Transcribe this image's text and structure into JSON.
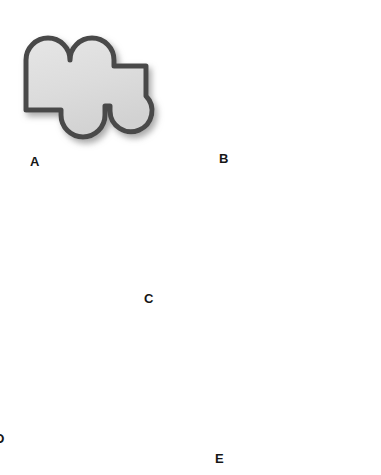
{
  "figure": {
    "background_color": "#ffffff",
    "shape_fill_color": "#d8d8d8",
    "shape_fill_color_light": "#e4e4e4",
    "shape_stroke_color": "#4a4a4a",
    "shape_shadow_color": "#b4b4b4",
    "label_color": "#161616",
    "stroke_width": 5
  },
  "shapes": [
    {
      "id": "A",
      "label": "A",
      "label_x": 30,
      "label_y": 155,
      "description": "rectangle with two round lobes on top, one lobe bottom-left, one lobe bottom-right, plus right arm",
      "clipped": false
    },
    {
      "id": "B",
      "label": "B",
      "label_x": 219,
      "label_y": 152,
      "description": "horizontal bar with two lobes on left, three stacked lobes on right, lower rectangle foot",
      "clipped": false
    },
    {
      "id": "C",
      "label": "C",
      "label_x": 144,
      "label_y": 292,
      "description": "small rectangle with one lobe top-left, one lobe right, one lobe bottom-center",
      "clipped": false
    },
    {
      "id": "D",
      "label": "D",
      "label_x": 0,
      "label_y": 432,
      "description": "rectangle with two lobes on top, one lobe right, narrow rectangular stem below",
      "clipped": true
    },
    {
      "id": "E",
      "label": "E",
      "label_x": 215,
      "label_y": 452,
      "description": "stepped diagonal body with two lobes upper-left and three lobes on right side",
      "clipped": false
    }
  ]
}
